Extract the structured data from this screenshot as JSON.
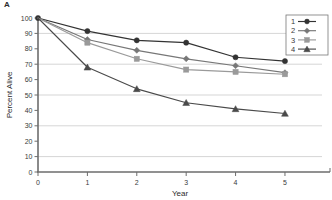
{
  "panel": {
    "label": "A"
  },
  "chart_data": {
    "type": "line",
    "title": "",
    "subtitle": "",
    "xlabel": "Year",
    "ylabel": "Percent Alive",
    "x": [
      0,
      1,
      2,
      3,
      4,
      5
    ],
    "xlim": [
      0,
      5.75
    ],
    "ylim": [
      0,
      100
    ],
    "xticks": [
      0,
      1,
      2,
      3,
      4,
      5
    ],
    "xtick_labels": [
      "0",
      "1",
      "2",
      "3",
      "4",
      "5"
    ],
    "yticks": [
      0,
      10,
      20,
      30,
      40,
      50,
      60,
      70,
      80,
      90,
      100
    ],
    "ytick_labels": [
      "0",
      "10",
      "20",
      "30",
      "40",
      "50",
      "60",
      "70",
      "80",
      "90",
      "100"
    ],
    "grid": true,
    "gridlines_y": [
      10,
      30,
      50,
      70,
      90
    ],
    "legend_position": "top-right",
    "series": [
      {
        "name": "1",
        "marker": "circle",
        "color": "#333333",
        "values": [
          100,
          91.5,
          85.5,
          84.0,
          74.5,
          72.0
        ]
      },
      {
        "name": "2",
        "marker": "diamond",
        "color": "#777777",
        "values": [
          100,
          86.0,
          79.0,
          73.5,
          69.0,
          64.5
        ]
      },
      {
        "name": "3",
        "marker": "square",
        "color": "#9a9a9a",
        "values": [
          100,
          84.0,
          73.5,
          66.5,
          65.0,
          63.5
        ]
      },
      {
        "name": "4",
        "marker": "triangle",
        "color": "#4a4a4a",
        "values": [
          100,
          68.0,
          54.0,
          45.0,
          41.0,
          38.0
        ]
      }
    ]
  },
  "legend": {
    "entries": [
      {
        "label": "1"
      },
      {
        "label": "2"
      },
      {
        "label": "3"
      },
      {
        "label": "4"
      }
    ]
  },
  "colors": {
    "axis": "#6d6d6d",
    "grid": "#b9b9b9",
    "text": "#2b2b2b",
    "background": "#ffffff"
  }
}
